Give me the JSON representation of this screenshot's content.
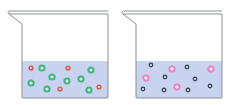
{
  "colors": {
    "liquid": "#c8d3f0",
    "glass": "#8a8f96",
    "red_particle": "#e0573f",
    "green_particle": "#3fb57f",
    "pink_particle": "#f07cbf",
    "dark_particle": "#404858"
  },
  "beakers": [
    {
      "name": "beaker-left",
      "offset_x": 0,
      "particles": [
        {
          "type": "red",
          "x": 31,
          "y": 68
        },
        {
          "type": "green",
          "x": 42,
          "y": 68
        },
        {
          "type": "green",
          "x": 52,
          "y": 77
        },
        {
          "type": "red",
          "x": 68,
          "y": 68
        },
        {
          "type": "green",
          "x": 91,
          "y": 70
        },
        {
          "type": "green",
          "x": 31,
          "y": 83
        },
        {
          "type": "green",
          "x": 67,
          "y": 81
        },
        {
          "type": "green",
          "x": 81,
          "y": 79
        },
        {
          "type": "green",
          "x": 47,
          "y": 89
        },
        {
          "type": "red",
          "x": 60,
          "y": 89
        },
        {
          "type": "green",
          "x": 89,
          "y": 90
        },
        {
          "type": "red",
          "x": 99,
          "y": 87
        }
      ]
    },
    {
      "name": "beaker-right",
      "offset_x": 114,
      "particles": [
        {
          "type": "dark",
          "x": 151,
          "y": 65
        },
        {
          "type": "pink",
          "x": 172,
          "y": 69
        },
        {
          "type": "dark",
          "x": 187,
          "y": 67
        },
        {
          "type": "pink",
          "x": 211,
          "y": 69
        },
        {
          "type": "pink",
          "x": 146,
          "y": 78
        },
        {
          "type": "dark",
          "x": 165,
          "y": 77
        },
        {
          "type": "dark",
          "x": 195,
          "y": 79
        },
        {
          "type": "dark",
          "x": 143,
          "y": 89
        },
        {
          "type": "dark",
          "x": 164,
          "y": 90
        },
        {
          "type": "pink",
          "x": 177,
          "y": 87
        },
        {
          "type": "dark",
          "x": 188,
          "y": 90
        },
        {
          "type": "dark",
          "x": 210,
          "y": 86
        }
      ]
    }
  ]
}
